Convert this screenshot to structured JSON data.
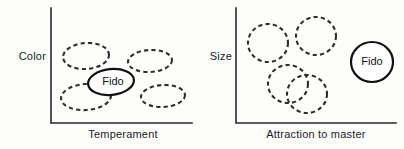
{
  "figure": {
    "background_color": "#fdfdfc",
    "ink_color": "#2a2a2a",
    "dashed_color": "#2e2e2e",
    "solid_color": "#111111"
  },
  "panels": [
    {
      "id": "left-panel",
      "name": "color-vs-temperament",
      "y_axis_label": "Color",
      "x_axis_label": "Temperament",
      "axis": {
        "x": 51,
        "y_top": 8,
        "y_bottom": 123,
        "x_right": 192
      },
      "clusters": [
        {
          "name": "cluster-upper-left",
          "style": "dashed",
          "cx": 86,
          "cy": 56,
          "rx": 23,
          "ry": 13,
          "rotate": -4
        },
        {
          "name": "cluster-upper-right",
          "style": "dashed",
          "cx": 150,
          "cy": 61,
          "rx": 22,
          "ry": 11,
          "rotate": -3
        },
        {
          "name": "cluster-lower-left",
          "style": "dashed",
          "cx": 86,
          "cy": 97,
          "rx": 25,
          "ry": 13,
          "rotate": -4
        },
        {
          "name": "cluster-lower-right",
          "style": "dashed",
          "cx": 163,
          "cy": 96,
          "rx": 22,
          "ry": 11,
          "rotate": -3
        }
      ],
      "highlight": {
        "name": "fido-cluster",
        "style": "solid",
        "label": "Fido",
        "cx": 111,
        "cy": 82,
        "rx": 23,
        "ry": 13,
        "rotate": -6,
        "label_x": 113,
        "label_y": 82
      }
    },
    {
      "id": "right-panel",
      "name": "size-vs-attraction-to-master",
      "y_axis_label": "Size",
      "x_axis_label": "Attraction to master",
      "axis": {
        "x": 236,
        "y_top": 8,
        "y_bottom": 123,
        "x_right": 396
      },
      "clusters": [
        {
          "name": "cluster-upper-left",
          "style": "dashed",
          "cx": 268,
          "cy": 43,
          "rx": 20,
          "ry": 19,
          "rotate": 0
        },
        {
          "name": "cluster-upper-right",
          "style": "dashed",
          "cx": 316,
          "cy": 36,
          "rx": 20,
          "ry": 19,
          "rotate": 0
        },
        {
          "name": "cluster-overlap-back",
          "style": "dashed",
          "cx": 288,
          "cy": 84,
          "rx": 20,
          "ry": 19,
          "rotate": 0
        },
        {
          "name": "cluster-overlap-front",
          "style": "dashed",
          "cx": 307,
          "cy": 94,
          "rx": 20,
          "ry": 19,
          "rotate": 0
        }
      ],
      "highlight": {
        "name": "fido-cluster",
        "style": "solid",
        "label": "Fido",
        "cx": 372,
        "cy": 62,
        "rx": 21,
        "ry": 20,
        "rotate": 0,
        "label_x": 372,
        "label_y": 62
      }
    }
  ]
}
